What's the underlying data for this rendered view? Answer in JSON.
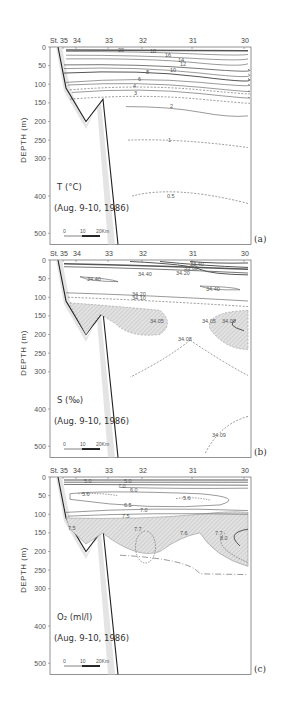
{
  "figure": {
    "panels": [
      {
        "id": "a",
        "panel_label": "(a)",
        "variable": "T (°C)",
        "date": "(Aug. 9-10, 1986)",
        "scale_labels": [
          "0",
          "10",
          "20Km"
        ]
      },
      {
        "id": "b",
        "panel_label": "(b)",
        "variable": "S (‰)",
        "date": "(Aug. 9-10, 1986)",
        "scale_labels": [
          "0",
          "10",
          "20Km"
        ]
      },
      {
        "id": "c",
        "panel_label": "(c)",
        "variable": "O₂ (ml/l)",
        "date": "(Aug. 9-10, 1986)",
        "scale_labels": [
          "0",
          "10",
          "20Km"
        ]
      }
    ]
  },
  "chart_data": [
    {
      "type": "contour",
      "title": "T (°C) (Aug. 9-10, 1986)",
      "panel": "(a)",
      "xlabel": "St.",
      "ylabel": "DEPTH (m)",
      "stations": [
        "35",
        "34",
        "33",
        "32",
        "31",
        "30"
      ],
      "station_label": "St.",
      "yticks": [
        0,
        50,
        100,
        150,
        200,
        250,
        300,
        400,
        500
      ],
      "ylim": [
        0,
        530
      ],
      "contour_labels": [
        "20",
        "18",
        "16",
        "14",
        "12",
        "10",
        "8",
        "6",
        "4",
        "3",
        "2",
        "1",
        "0.5"
      ]
    },
    {
      "type": "contour",
      "title": "S (‰) (Aug. 9-10, 1986)",
      "panel": "(b)",
      "xlabel": "St.",
      "ylabel": "DEPTH (m)",
      "stations": [
        "35",
        "34",
        "33",
        "32",
        "31",
        "30"
      ],
      "station_label": "St.",
      "yticks": [
        0,
        50,
        100,
        150,
        200,
        250,
        300,
        400,
        500
      ],
      "ylim": [
        0,
        530
      ],
      "contour_labels": [
        "33.40",
        "33.60",
        "34.00",
        "34.20",
        "34.40",
        "34.20",
        "34.10",
        "34.05",
        "34.05",
        "34.00",
        "34.08",
        "34.09",
        "34.40"
      ]
    },
    {
      "type": "contour",
      "title": "O₂ (ml/l) (Aug. 9-10, 1986)",
      "panel": "(c)",
      "xlabel": "St.",
      "ylabel": "DEPTH (m)",
      "stations": [
        "35",
        "34",
        "33",
        "32",
        "31",
        "30"
      ],
      "station_label": "St.",
      "yticks": [
        0,
        50,
        100,
        150,
        200,
        250,
        300,
        400,
        500
      ],
      "ylim": [
        0,
        530
      ],
      "contour_labels": [
        "5.0",
        "5.0",
        "7.0",
        "6.0",
        "5.6",
        "5.6",
        "6.5",
        "7.0",
        "7.5",
        "7.5",
        "7.7",
        "7.6",
        "7.7",
        "8.0"
      ]
    }
  ]
}
